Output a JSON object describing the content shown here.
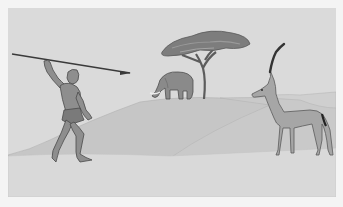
{
  "scene": {
    "description": "Grayscale illustration of a hunter raising a spear on a savanna, with an elephant under an acacia tree on a hill and an antelope standing on the right",
    "subjects": [
      "hunter-with-spear",
      "elephant",
      "acacia-tree",
      "antelope"
    ],
    "colors": {
      "background_margin": "#f4f4f4",
      "sky": "#dadada",
      "far_hill": "#cbcbcb",
      "near_hill": "#c6c6c6",
      "ground": "#d9d9d9",
      "figure_fill": "#8e8e8e",
      "figure_stroke": "#4a4a4a",
      "antelope_fill": "#a6a6a6",
      "tree_foliage": "#7d7d7d",
      "dark": "#333333"
    }
  }
}
